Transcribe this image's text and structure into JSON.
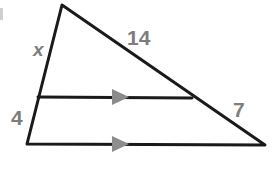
{
  "figure": {
    "type": "geometry-diagram",
    "background_color": "#ffffff",
    "stroke_color": "#1a1a1a",
    "label_color": "#7d7d7d",
    "arrow_color": "#8c8c8c"
  },
  "labels": {
    "side_left_upper": "x",
    "side_hypotenuse_upper": "14",
    "side_left_lower": "4",
    "side_hypotenuse_lower": "7"
  },
  "geometry": {
    "apex": {
      "x": 62,
      "y": 5
    },
    "bottom_left": {
      "x": 27,
      "y": 144
    },
    "bottom_right": {
      "x": 265,
      "y": 145
    },
    "midline_left": {
      "x": 38,
      "y": 97
    },
    "midline_right": {
      "x": 192,
      "y": 98
    },
    "arrow_midline": {
      "x": 120,
      "y": 97
    },
    "arrow_baseline": {
      "x": 120,
      "y": 144
    }
  }
}
